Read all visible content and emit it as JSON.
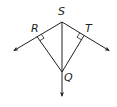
{
  "diagram": {
    "type": "geometry",
    "stroke_color": "#231f20",
    "background": "#ffffff",
    "points": {
      "S": {
        "label": "S",
        "x": 62,
        "y": 22
      },
      "R": {
        "label": "R",
        "x": 37,
        "y": 36
      },
      "T": {
        "label": "T",
        "x": 84,
        "y": 36
      },
      "Q": {
        "label": "Q",
        "x": 62,
        "y": 72
      }
    },
    "rays": [
      {
        "from": "S",
        "through": "R",
        "end": [
          13,
          51
        ]
      },
      {
        "from": "S",
        "through": "T",
        "end": [
          110,
          51
        ]
      },
      {
        "from": "S",
        "through": "Q",
        "end": [
          62,
          97
        ]
      }
    ],
    "segments": [
      {
        "from": "R",
        "to": "Q"
      },
      {
        "from": "T",
        "to": "Q"
      }
    ],
    "right_angles": [
      "R",
      "T"
    ],
    "labels": {
      "S": "S",
      "R": "R",
      "T": "T",
      "Q": "Q"
    }
  }
}
